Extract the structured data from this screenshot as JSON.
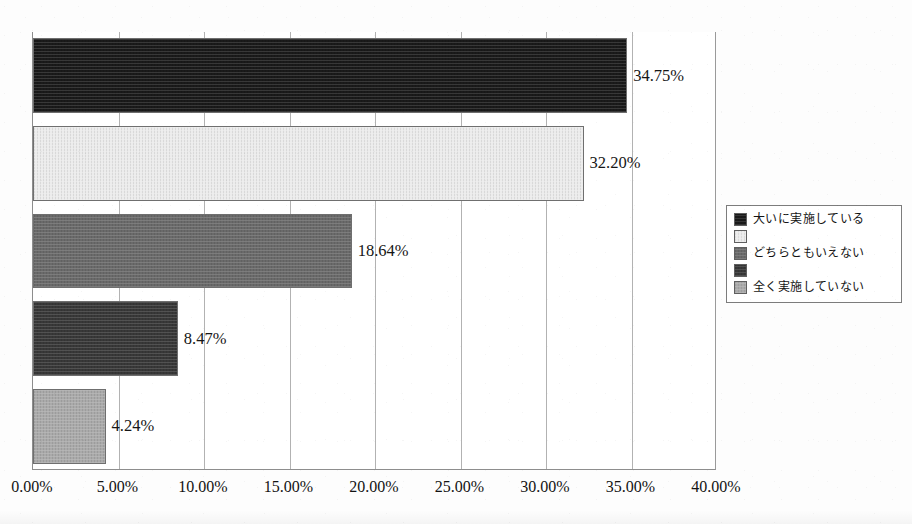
{
  "chart_data": {
    "type": "bar",
    "orientation": "horizontal",
    "title": "",
    "xlabel": "",
    "ylabel": "",
    "xlim": [
      0,
      40
    ],
    "x_tick_labels": [
      "0.00%",
      "5.00%",
      "10.00%",
      "15.00%",
      "20.00%",
      "25.00%",
      "30.00%",
      "35.00%",
      "40.00%"
    ],
    "x_tick_values": [
      0,
      5,
      10,
      15,
      20,
      25,
      30,
      35,
      40
    ],
    "grid": "vertical",
    "legend_position": "right",
    "categories": [
      "大いに実施している",
      "",
      "どちらともいえない",
      "",
      "全く実施していない"
    ],
    "values": [
      34.75,
      32.2,
      18.64,
      8.47,
      4.24
    ],
    "value_labels": [
      "34.75%",
      "32.20%",
      "18.64%",
      "8.47%",
      "4.24%"
    ],
    "bar_colors": [
      "#1a1a1a",
      "#ececec",
      "#6a6a6a",
      "#383838",
      "#aaaaaa"
    ],
    "bars": [
      {
        "label": "大いに実施している",
        "value": 34.75,
        "value_label": "34.75%",
        "color": "#1a1a1a"
      },
      {
        "label": "",
        "value": 32.2,
        "value_label": "32.20%",
        "color": "#ececec"
      },
      {
        "label": "どちらともいえない",
        "value": 18.64,
        "value_label": "18.64%",
        "color": "#6a6a6a"
      },
      {
        "label": "",
        "value": 8.47,
        "value_label": "8.47%",
        "color": "#383838"
      },
      {
        "label": "全く実施していない",
        "value": 4.24,
        "value_label": "4.24%",
        "color": "#aaaaaa"
      }
    ]
  },
  "legend": {
    "items": [
      {
        "label": "大いに実施している",
        "color": "#1a1a1a"
      },
      {
        "label": "",
        "color": "#ececec"
      },
      {
        "label": "どちらともいえない",
        "color": "#6a6a6a"
      },
      {
        "label": "",
        "color": "#383838"
      },
      {
        "label": "全く実施していない",
        "color": "#aaaaaa"
      }
    ]
  },
  "colors": {
    "axis": "#8d8d8d",
    "gridline": "#b2b2b2",
    "text": "#141414",
    "background": "#ffffff"
  }
}
